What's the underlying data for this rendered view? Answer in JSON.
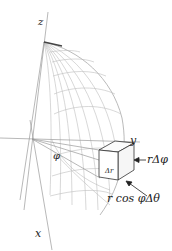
{
  "diagram": {
    "type": "spherical-coordinates-volume-element",
    "axes": {
      "z_label": "z",
      "y_label": "y",
      "x_label": "x"
    },
    "angle_label": "φ",
    "volume_element": {
      "radial_label": "Δr",
      "phi_side_label": "rΔφ",
      "theta_side_label": "r cos φΔθ"
    },
    "colors": {
      "wireframe": "#b8b8b8",
      "axis": "#9a9a9a",
      "box": "#333333",
      "text": "#222222"
    }
  }
}
